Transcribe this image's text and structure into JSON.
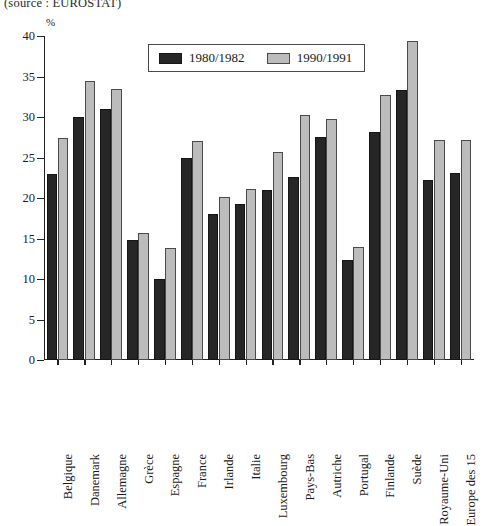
{
  "caption": {
    "source": "(source : EUROSTAT)"
  },
  "legend": {
    "position": "top-center",
    "entries": [
      {
        "label": "1980/1982",
        "color": "#262626",
        "swatch_name": "legend-swatch-1980"
      },
      {
        "label": "1990/1991",
        "color": "#bcbcbc",
        "swatch_name": "legend-swatch-1990"
      }
    ]
  },
  "chart_data": {
    "type": "bar",
    "title": "",
    "subtitle": "(source : EUROSTAT)",
    "xlabel": "",
    "ylabel": "%",
    "ylim": [
      0,
      40
    ],
    "yticks": [
      0,
      5,
      10,
      15,
      20,
      25,
      30,
      35,
      40
    ],
    "grid": false,
    "legend_position": "top-center",
    "categories": [
      "Belgique",
      "Danemark",
      "Allemagne",
      "Grèce",
      "Espagne",
      "France",
      "Irlande",
      "Italie",
      "Luxembourg",
      "Pays-Bas",
      "Autriche",
      "Portugal",
      "Finlande",
      "Suède",
      "Royaume-Uni",
      "Europe des 15"
    ],
    "series": [
      {
        "name": "1980/1982",
        "color": "#262626",
        "values": [
          23.0,
          30.0,
          31.0,
          14.8,
          10.0,
          25.0,
          18.0,
          19.2,
          21.0,
          22.6,
          27.5,
          12.4,
          28.1,
          33.3,
          22.2,
          23.1
        ]
      },
      {
        "name": "1990/1991",
        "color": "#bcbcbc",
        "values": [
          27.4,
          34.5,
          33.4,
          15.7,
          13.8,
          27.0,
          20.1,
          21.1,
          25.7,
          30.2,
          29.7,
          14.0,
          32.7,
          39.4,
          27.2,
          27.2
        ]
      }
    ]
  }
}
